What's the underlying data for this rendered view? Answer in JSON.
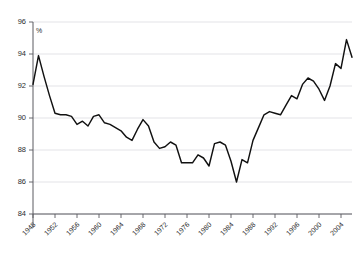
{
  "chart_data": {
    "type": "line",
    "title": "",
    "subtitle": "",
    "xlabel": "",
    "ylabel": "",
    "unit_label": "%",
    "ylim": [
      84,
      96
    ],
    "xlim": [
      1948,
      2006
    ],
    "grid": true,
    "legend": null,
    "yticks": [
      84,
      86,
      88,
      90,
      92,
      94,
      96
    ],
    "xticks": [
      1948,
      1952,
      1956,
      1960,
      1964,
      1968,
      1972,
      1976,
      1980,
      1984,
      1988,
      1992,
      1996,
      2000,
      2004
    ],
    "series": [
      {
        "name": "rate",
        "x": [
          1948,
          1949,
          1950,
          1951,
          1952,
          1953,
          1954,
          1955,
          1956,
          1957,
          1958,
          1959,
          1960,
          1961,
          1962,
          1963,
          1964,
          1965,
          1966,
          1967,
          1968,
          1969,
          1970,
          1971,
          1972,
          1973,
          1974,
          1975,
          1976,
          1977,
          1978,
          1979,
          1980,
          1981,
          1982,
          1983,
          1984,
          1985,
          1986,
          1987,
          1988,
          1989,
          1990,
          1991,
          1992,
          1993,
          1994,
          1995,
          1996,
          1997,
          1998,
          1999,
          2000,
          2001,
          2002,
          2003,
          2004,
          2005,
          2006
        ],
        "values": [
          92.1,
          93.9,
          92.6,
          91.4,
          90.3,
          90.2,
          90.2,
          90.1,
          89.6,
          89.8,
          89.5,
          90.1,
          90.2,
          89.7,
          89.6,
          89.4,
          89.2,
          88.8,
          88.6,
          89.3,
          89.9,
          89.5,
          88.5,
          88.1,
          88.2,
          88.5,
          88.3,
          87.2,
          87.2,
          87.2,
          87.7,
          87.5,
          87.0,
          88.4,
          88.5,
          88.3,
          87.3,
          86.0,
          87.4,
          87.2,
          88.6,
          89.4,
          90.2,
          90.4,
          90.3,
          90.2,
          90.8,
          91.4,
          91.2,
          92.1,
          92.5,
          92.3,
          91.8,
          91.1,
          92.0,
          93.4,
          93.1,
          94.9,
          93.8
        ]
      }
    ]
  }
}
